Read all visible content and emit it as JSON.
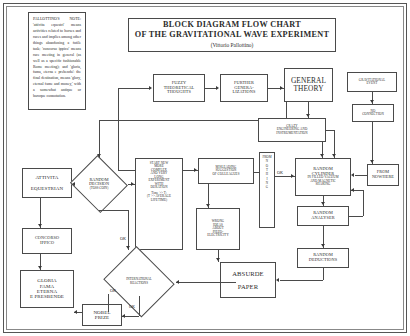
{
  "document": {
    "title_line1": "BLOCK DIAGRAM FLOW CHART",
    "title_line2": "OF THE GRAVITATIONAL WAVE EXPERIMENT",
    "title_author": "(Vittorio Pallottino)"
  },
  "note": {
    "text": "PALLOTTINO'S NOTE: 'attivita equestri' means activities related to horses and races and implies among other things abandoning a futile task; 'concorso ippico' means race meeting in general (as well as a specific fashionable Rome meeting); and 'gloria, fama, eterna e prebenda': the final destination, means 'glory, eternal fame and money,' with a somewhat antique or baroque connotation."
  },
  "nodes": {
    "fuzzy": {
      "lines": [
        "FUZZY",
        "THEORETICAL",
        "THOUGHTS"
      ]
    },
    "further": {
      "lines": [
        "FURTHER",
        "GENERA-",
        "LIZATIONS"
      ]
    },
    "general_theory": {
      "lines": [
        "GENERAL",
        "THEORY"
      ]
    },
    "grav_event": {
      "lines": [
        "GRAVITATIONAL",
        "EVENT"
      ]
    },
    "no_connection": {
      "lines": [
        "NO",
        "CONNECTION"
      ]
    },
    "crazy_eng": {
      "lines": [
        "CRAZY",
        "ENGINEERING AND",
        "INSTRUMENTATION"
      ]
    },
    "attivita": {
      "lines": [
        "ATTIVITA",
        "EQUESTRIAN"
      ]
    },
    "random_decision": {
      "lines": [
        "RANDOM",
        "DECISION"
      ],
      "sub": "(TOSS COIN)"
    },
    "start_new": {
      "lines": [
        "START NEW",
        "MORE",
        "COMPLEX",
        "AND VERY",
        "LONG",
        "EXPERIMENT",
        "WITH",
        "DURATION"
      ],
      "formula1": "Time >> T;",
      "formula2": "(T >> AVERAGE",
      "formula3": "LIFETIME)"
    },
    "misleading": {
      "lines": [
        "MISLEADING",
        "SUGGESTION",
        "OF COLLEAGUES"
      ]
    },
    "from_nothing": {
      "letters": [
        "F",
        "R",
        "O",
        "M"
      ],
      "letters2": [
        "N",
        "O",
        "T",
        "H",
        "I",
        "N",
        "G"
      ],
      "top": "FROM"
    },
    "random_cylinder": {
      "lines": [
        "RANDOM",
        "CYLINDER"
      ],
      "sub": [
        "IN FILLED VACUUM",
        "AND MAGNETIC",
        "SHAKING"
      ]
    },
    "from_nowhere": {
      "lines": [
        "FROM",
        "NOWHERE"
      ]
    },
    "random_analyser": {
      "lines": [
        "RANDOM",
        "ANALYSER"
      ]
    },
    "random_deductions": {
      "lines": [
        "RANDOM",
        "DEDUCTIONS"
      ]
    },
    "wrong_ideas": {
      "lines": [
        "WRONG",
        "IDEAS",
        "ABOUT",
        "PIEZO-",
        "ELECTRICITY"
      ]
    },
    "absurde_paper": {
      "lines": [
        "ABSURDE",
        "PAPER"
      ]
    },
    "concorso": {
      "lines": [
        "CONCORSO",
        "IPPICO"
      ]
    },
    "gloria": {
      "lines": [
        "GLORIA",
        "FAMA",
        "ETERNA",
        "E PRESBENDE"
      ]
    },
    "international": {
      "lines": [
        "INTERNATIONAL",
        "REACTIONS"
      ]
    },
    "nobel": {
      "lines": [
        "NOBEL",
        "PRIZE"
      ]
    }
  },
  "edge_labels": {
    "ok_decision": "OK",
    "ok_reactions": "OK",
    "ok_nobel": "OK",
    "not_ok": "OK"
  },
  "colors": {
    "stroke": "#4a4a4a",
    "text": "#2b2b2b",
    "background": "#ffffff"
  }
}
